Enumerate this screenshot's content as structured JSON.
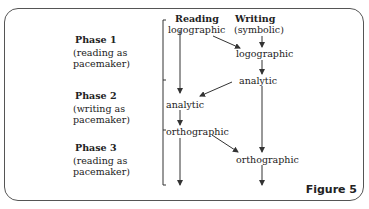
{
  "columns": {
    "reading": "Reading",
    "writing": "Writing"
  },
  "phases": [
    {
      "title": "Phase 1",
      "line1": "(reading as",
      "line2": "pacemaker)"
    },
    {
      "title": "Phase 2",
      "line1": "(writing as",
      "line2": "pacemaker)"
    },
    {
      "title": "Phase 3",
      "line1": "(reading as",
      "line2": "pacemaker)"
    }
  ],
  "nodes": {
    "writing_start": "(symbolic)",
    "reading_logographic": "logographic",
    "writing_logographic": "logographic",
    "writing_analytic": "analytic",
    "reading_analytic": "analytic",
    "reading_orthographic": "orthographic",
    "writing_orthographic": "orthographic"
  },
  "figure_label": "Figure 5"
}
